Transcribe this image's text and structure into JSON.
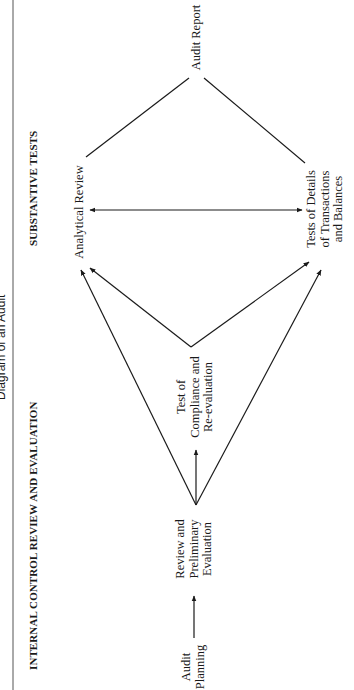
{
  "title": "Diagram of an Audit",
  "headers": {
    "left_section": "INTERNAL CONTROL REVIEW AND EVALUATION",
    "right_section": "SUBSTANTIVE TESTS"
  },
  "nodes": {
    "audit_planning": [
      "Audit",
      "Planning"
    ],
    "review_preliminary": [
      "Review and",
      "Preliminary",
      "Evaluation"
    ],
    "test_compliance": [
      "Test of",
      "Compliance and",
      "Re-evaluation"
    ],
    "analytical_review": [
      "Analytical Review"
    ],
    "tests_of_details": [
      "Tests of Details",
      "of Transactions",
      "and Balances"
    ],
    "audit_report": [
      "Audit Report"
    ]
  },
  "edges": [
    {
      "from": "Audit Planning",
      "to": "Review and Preliminary Evaluation",
      "type": "arrow"
    },
    {
      "from": "Review and Preliminary Evaluation",
      "to": "Test of Compliance and Re-evaluation",
      "type": "arrow"
    },
    {
      "from": "Review and Preliminary Evaluation",
      "to": "Analytical Review",
      "type": "arrow"
    },
    {
      "from": "Review and Preliminary Evaluation",
      "to": "Tests of Details of Transactions and Balances",
      "type": "arrow"
    },
    {
      "from": "Test of Compliance and Re-evaluation",
      "to": "Analytical Review",
      "type": "arrow"
    },
    {
      "from": "Test of Compliance and Re-evaluation",
      "to": "Tests of Details of Transactions and Balances",
      "type": "arrow"
    },
    {
      "from": "Analytical Review",
      "to": "Tests of Details of Transactions and Balances",
      "type": "double-arrow"
    },
    {
      "from": "Analytical Review",
      "to": "Audit Report",
      "type": "line"
    },
    {
      "from": "Tests of Details of Transactions and Balances",
      "to": "Audit Report",
      "type": "line"
    }
  ],
  "orientation": "rotated 90° counter-clockwise"
}
